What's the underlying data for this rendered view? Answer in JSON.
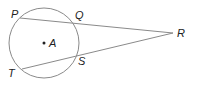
{
  "diagram": {
    "type": "geometry",
    "circle": {
      "center_label": "A",
      "cx": 44,
      "cy": 43,
      "r": 35
    },
    "points": {
      "P": {
        "label": "P",
        "x": 20,
        "y": 18
      },
      "Q": {
        "label": "Q",
        "x": 77,
        "y": 23
      },
      "R": {
        "label": "R",
        "x": 173,
        "y": 33
      },
      "S": {
        "label": "S",
        "x": 79,
        "y": 54
      },
      "T": {
        "label": "T",
        "x": 22,
        "y": 69
      },
      "A": {
        "label": "A",
        "x": 44,
        "y": 43
      }
    },
    "segments": [
      [
        "P",
        "R"
      ],
      [
        "T",
        "R"
      ]
    ],
    "stroke_color": "#8a8a8a",
    "label_color": "#222222"
  }
}
